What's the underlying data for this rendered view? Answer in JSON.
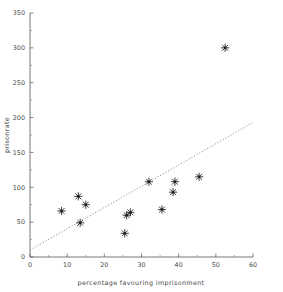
{
  "chart_data": {
    "type": "scatter",
    "title": "",
    "xlabel": "percentage favouring imprisonment",
    "ylabel": "prisonrate",
    "xlim": [
      0,
      60
    ],
    "ylim": [
      0,
      350
    ],
    "xticks": [
      0,
      10,
      20,
      30,
      40,
      50,
      60
    ],
    "xtick_labels": [
      "0",
      "10",
      "20",
      "30",
      "40",
      "50",
      "60"
    ],
    "yticks": [
      0,
      50,
      100,
      150,
      200,
      250,
      300,
      350
    ],
    "ytick_labels": [
      "0",
      "50",
      "100",
      "150",
      "200",
      "250",
      "300",
      "350"
    ],
    "grid": false,
    "legend": null,
    "marker_style": "asterisk",
    "points": [
      {
        "x": 8.5,
        "y": 66
      },
      {
        "x": 13.0,
        "y": 87
      },
      {
        "x": 13.5,
        "y": 49
      },
      {
        "x": 15.0,
        "y": 75
      },
      {
        "x": 25.5,
        "y": 34
      },
      {
        "x": 26.0,
        "y": 60
      },
      {
        "x": 27.0,
        "y": 64
      },
      {
        "x": 32.0,
        "y": 108
      },
      {
        "x": 35.5,
        "y": 68
      },
      {
        "x": 38.5,
        "y": 93
      },
      {
        "x": 39.0,
        "y": 108
      },
      {
        "x": 45.5,
        "y": 115
      },
      {
        "x": 52.5,
        "y": 300
      }
    ],
    "fit_line": {
      "style": "dotted",
      "x_start": 0,
      "y_start": 10,
      "x_end": 60,
      "y_end": 193
    },
    "colors": {
      "marker": "#1a1a1a",
      "axis": "#555555",
      "fit_line": "#666666",
      "background": "#ffffff"
    }
  }
}
